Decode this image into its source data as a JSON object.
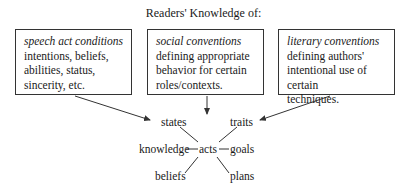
{
  "title": "Readers' Knowledge of:",
  "boxes": [
    {
      "heading": "speech act conditions",
      "lines": [
        "intentions, beliefs,",
        "abilities, status,",
        "sincerity, etc."
      ]
    },
    {
      "heading": "social conventions",
      "lines": [
        "defining appropriate",
        "behavior for certain",
        "roles/contexts."
      ]
    },
    {
      "heading": "literary conventions",
      "lines": [
        "defining authors'",
        "intentional use of certain",
        "techniques."
      ]
    }
  ],
  "network": {
    "center": "acts",
    "nodes": {
      "states": "states",
      "traits": "traits",
      "knowledge": "knowledge",
      "goals": "goals",
      "beliefs": "beliefs",
      "plans": "plans"
    }
  }
}
